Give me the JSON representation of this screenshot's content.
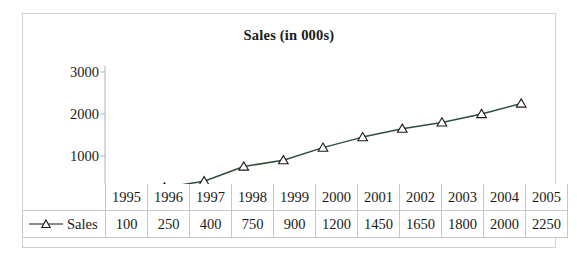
{
  "chart_data": {
    "type": "line",
    "title": "Sales (in 000s)",
    "xlabel": "",
    "ylabel": "",
    "categories": [
      "1995",
      "1996",
      "1997",
      "1998",
      "1999",
      "2000",
      "2001",
      "2002",
      "2003",
      "2004",
      "2005"
    ],
    "series": [
      {
        "name": "Sales",
        "values": [
          100,
          250,
          400,
          750,
          900,
          1200,
          1450,
          1650,
          1800,
          2000,
          2250
        ]
      }
    ],
    "ylim": [
      0,
      3000
    ],
    "yticks": [
      "0",
      "1000",
      "2000",
      "3000"
    ],
    "ytick_values": [
      0,
      1000,
      2000,
      3000
    ],
    "grid": false,
    "legend_position": "table-row-left",
    "marker": "triangle-open",
    "line_color": "#2f4f3a",
    "marker_edge_color": "#1a1a1a",
    "marker_fill_color": "#ffffff",
    "axis_color": "#b9b9b9",
    "border_color": "#d2d2d2",
    "text_color": "#1a1a1a"
  },
  "table": {
    "value_row_label": "Sales",
    "years": [
      "1995",
      "1996",
      "1997",
      "1998",
      "1999",
      "2000",
      "2001",
      "2002",
      "2003",
      "2004",
      "2005"
    ],
    "values": [
      "100",
      "250",
      "400",
      "750",
      "900",
      "1200",
      "1450",
      "1650",
      "1800",
      "2000",
      "2250"
    ]
  }
}
